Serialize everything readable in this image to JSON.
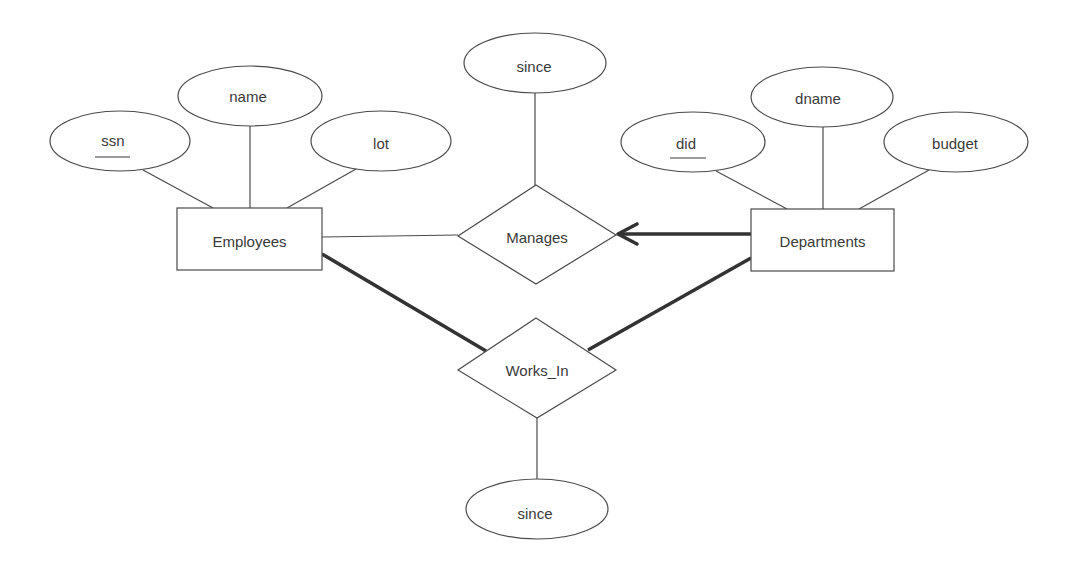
{
  "diagram": {
    "type": "entity-relationship",
    "entities": [
      {
        "id": "employees",
        "label": "Employees",
        "x": 177,
        "y": 208,
        "w": 145,
        "h": 62
      },
      {
        "id": "departments",
        "label": "Departments",
        "x": 751,
        "y": 209,
        "w": 143,
        "h": 62
      }
    ],
    "relationships": [
      {
        "id": "manages",
        "label": "Manages",
        "cx": 537,
        "cy": 235,
        "hw": 79,
        "hh": 50
      },
      {
        "id": "works_in",
        "label": "Works_In",
        "cx": 537,
        "cy": 368,
        "hw": 79,
        "hh": 50
      }
    ],
    "attributes": [
      {
        "id": "ssn",
        "label": "ssn",
        "key": true,
        "cx": 120,
        "cy": 141,
        "rx": 70,
        "ry": 30,
        "owner": "employees"
      },
      {
        "id": "name",
        "label": "name",
        "key": false,
        "cx": 250,
        "cy": 96,
        "rx": 72,
        "ry": 30,
        "owner": "employees"
      },
      {
        "id": "lot",
        "label": "lot",
        "key": false,
        "cx": 381,
        "cy": 141,
        "rx": 70,
        "ry": 30,
        "owner": "employees"
      },
      {
        "id": "manages_since",
        "label": "since",
        "key": false,
        "cx": 535,
        "cy": 63,
        "rx": 71,
        "ry": 30,
        "owner": "manages"
      },
      {
        "id": "did",
        "label": "did",
        "key": true,
        "cx": 693,
        "cy": 142,
        "rx": 72,
        "ry": 30,
        "owner": "departments"
      },
      {
        "id": "dname",
        "label": "dname",
        "key": false,
        "cx": 822,
        "cy": 97,
        "rx": 71,
        "ry": 30,
        "owner": "departments"
      },
      {
        "id": "budget",
        "label": "budget",
        "key": false,
        "cx": 956,
        "cy": 142,
        "rx": 72,
        "ry": 30,
        "owner": "departments"
      },
      {
        "id": "works_in_since",
        "label": "since",
        "key": false,
        "cx": 537,
        "cy": 509,
        "rx": 71,
        "ry": 30,
        "owner": "works_in"
      }
    ],
    "connections": [
      {
        "from": "employees",
        "to": "manages",
        "style": "thin",
        "participation": "partial"
      },
      {
        "from": "departments",
        "to": "manages",
        "style": "thick-arrow",
        "participation": "total",
        "key_constraint": true
      },
      {
        "from": "employees",
        "to": "works_in",
        "style": "thick",
        "participation": "total"
      },
      {
        "from": "departments",
        "to": "works_in",
        "style": "thick",
        "participation": "total"
      }
    ],
    "colors": {
      "stroke": "#4a4a4a",
      "thick_stroke": "#333333",
      "text": "#3a3a3a",
      "background": "#ffffff"
    }
  }
}
